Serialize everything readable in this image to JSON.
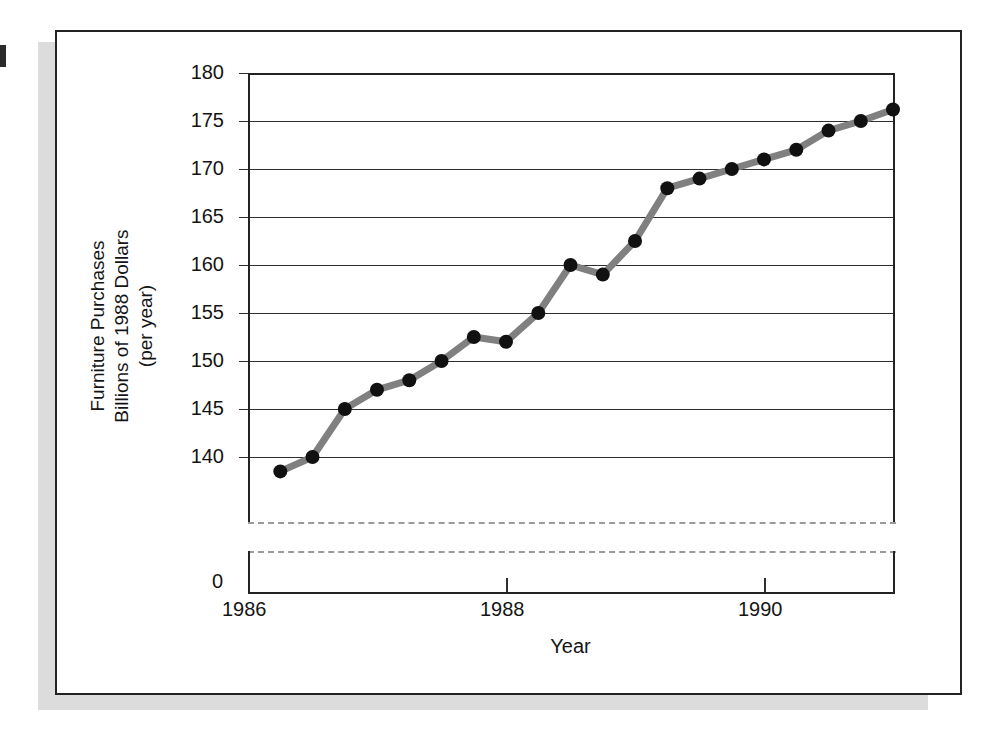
{
  "figure": {
    "background_color": "#ffffff",
    "border_color": "#232323",
    "shadow_color": "#dcdcdc"
  },
  "chart_data": {
    "type": "line",
    "title": "",
    "xlabel": "Year",
    "ylabel": "Furniture Purchases Billions of 1988 Dollars (per year)",
    "ylabel_lines": [
      "Furniture Purchases",
      "Billions of 1988 Dollars",
      "(per year)"
    ],
    "xlim": [
      1986.0,
      1991.0
    ],
    "ylim": [
      136.0,
      180.0
    ],
    "axis_break": true,
    "axis_break_note": "y-axis broken between 0 and ~137",
    "zero_label": "0",
    "grid": true,
    "grid_axis": "y",
    "legend": "none",
    "line_color": "#808080",
    "marker_color": "#111111",
    "marker": "circle",
    "yticks": [
      180,
      175,
      170,
      165,
      160,
      155,
      150,
      145,
      140
    ],
    "ytick_labels": [
      "180",
      "175",
      "170",
      "165",
      "160",
      "155",
      "150",
      "145",
      "140"
    ],
    "xticks": [
      1986,
      1988,
      1990
    ],
    "xtick_labels": [
      "1986",
      "1988",
      "1990"
    ],
    "x": [
      1986.25,
      1986.5,
      1986.75,
      1987.0,
      1987.25,
      1987.5,
      1987.75,
      1988.0,
      1988.25,
      1988.5,
      1988.75,
      1989.0,
      1989.25,
      1989.5,
      1989.75,
      1990.0,
      1990.25,
      1990.5,
      1990.75,
      1991.0
    ],
    "values": [
      138.5,
      140.0,
      145.0,
      147.0,
      148.0,
      150.0,
      152.5,
      152.0,
      155.0,
      160.0,
      159.0,
      162.5,
      168.0,
      169.0,
      170.0,
      171.0,
      172.0,
      174.0,
      175.0,
      176.2
    ],
    "series": [
      {
        "name": "Furniture Purchases",
        "values": [
          138.5,
          140.0,
          145.0,
          147.0,
          148.0,
          150.0,
          152.5,
          152.0,
          155.0,
          160.0,
          159.0,
          162.5,
          168.0,
          169.0,
          170.0,
          171.0,
          172.0,
          174.0,
          175.0,
          176.2
        ]
      }
    ]
  }
}
